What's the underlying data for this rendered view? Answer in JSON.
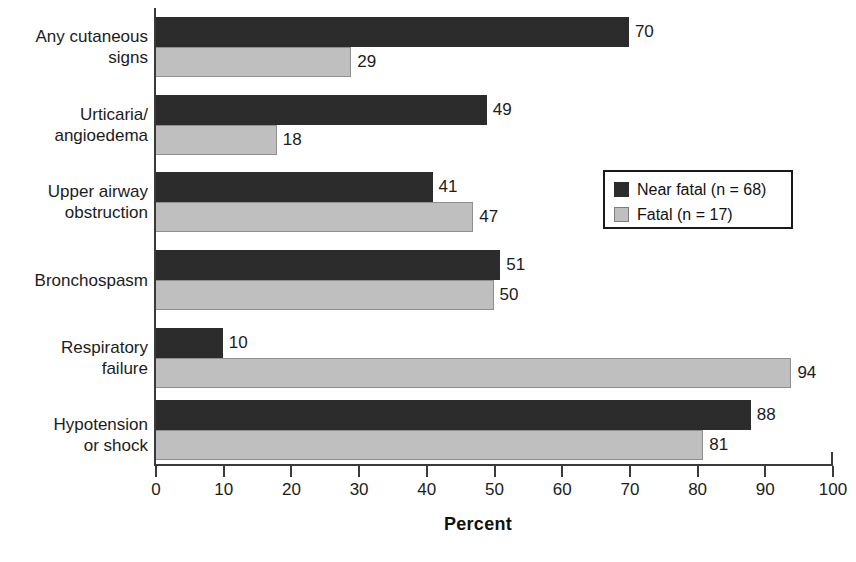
{
  "chart_data": {
    "type": "bar",
    "orientation": "horizontal",
    "title": "",
    "xlabel": "Percent",
    "ylabel": "",
    "xlim": [
      0,
      100
    ],
    "grid": false,
    "legend_position": "middle-right",
    "categories": [
      "Any cutaneous\nsigns",
      "Urticaria/\nangioedema",
      "Upper airway\nobstruction",
      "Bronchospasm",
      "Respiratory\nfailure",
      "Hypotension\nor shock"
    ],
    "xticks": [
      "0",
      "10",
      "20",
      "30",
      "40",
      "50",
      "60",
      "70",
      "80",
      "90",
      "100"
    ],
    "series": [
      {
        "name": "Near fatal (n = 68)",
        "color": "#2c2c2c",
        "values": [
          70,
          49,
          41,
          51,
          10,
          88
        ]
      },
      {
        "name": "Fatal (n = 17)",
        "color": "#bfbfbf",
        "values": [
          29,
          18,
          47,
          50,
          94,
          81
        ]
      }
    ]
  },
  "legend": {
    "items": [
      {
        "label": "Near fatal (n = 68)",
        "swatch": "dark-swatch-icon"
      },
      {
        "label": "Fatal (n = 17)",
        "swatch": "light-swatch-icon"
      }
    ]
  },
  "axis": {
    "x_title": "Percent"
  }
}
